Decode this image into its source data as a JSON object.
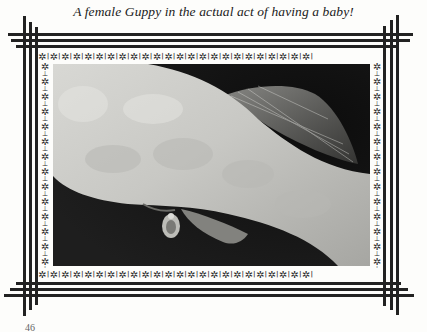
{
  "caption": "A female Guppy in the actual act of having a baby!",
  "page_number": "46",
  "photo": {
    "subject": "female guppy giving birth",
    "alt": "Close-up photograph of a female guppy releasing a newborn fry"
  },
  "frame": {
    "line_color": "#222222",
    "ornament_glyph": "✲",
    "separator_glyph": "ǀ"
  }
}
